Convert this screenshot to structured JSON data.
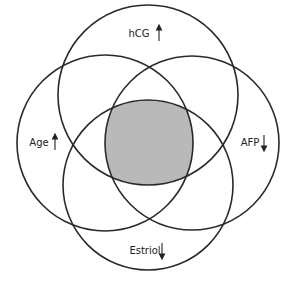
{
  "diagram": {
    "type": "venn",
    "sets": [
      {
        "id": "hcg",
        "label": "hCG",
        "direction": "up"
      },
      {
        "id": "age",
        "label": "Age",
        "direction": "up"
      },
      {
        "id": "afp",
        "label": "AFP",
        "direction": "down"
      },
      {
        "id": "estriol",
        "label": "Estriol",
        "direction": "down"
      }
    ],
    "highlighted_region": "intersection of all four sets",
    "colors": {
      "stroke": "#2a2a2a",
      "highlight_fill": "#b9b9b9",
      "background": "#ffffff"
    }
  }
}
